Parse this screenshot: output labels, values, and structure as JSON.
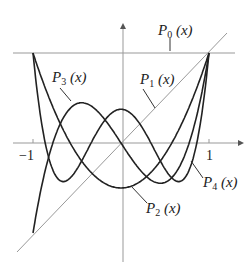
{
  "chart_data": {
    "type": "line",
    "title": "",
    "xlabel": "",
    "ylabel": "",
    "xlim": [
      -1.2,
      1.2
    ],
    "ylim": [
      -1.2,
      1.05
    ],
    "grid": false,
    "x_ticks": [
      "-1",
      "1"
    ],
    "series": [
      {
        "name": "P0(x)",
        "formula": "1",
        "label_main": "P",
        "label_sub": "0",
        "label_arg": "(x)"
      },
      {
        "name": "P1(x)",
        "formula": "x",
        "label_main": "P",
        "label_sub": "1",
        "label_arg": "(x)"
      },
      {
        "name": "P2(x)",
        "formula": "(3x^2-1)/2",
        "label_main": "P",
        "label_sub": "2",
        "label_arg": "(x)"
      },
      {
        "name": "P3(x)",
        "formula": "(5x^3-3x)/2",
        "label_main": "P",
        "label_sub": "3",
        "label_arg": "(x)"
      },
      {
        "name": "P4(x)",
        "formula": "(35x^4-30x^2+3)/8",
        "label_main": "P",
        "label_sub": "4",
        "label_arg": "(x)"
      }
    ]
  },
  "axis": {
    "tick_neg1": "−1",
    "tick_pos1": "1"
  }
}
